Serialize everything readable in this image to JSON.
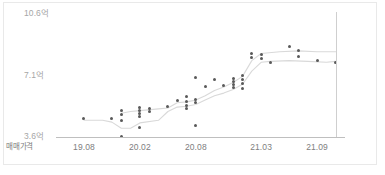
{
  "chart_data": {
    "type": "scatter",
    "title": "",
    "xlabel": "매매가격",
    "ylabel": "",
    "unit": "억",
    "grid": false,
    "legend": false,
    "y_ticks": [
      {
        "label": "3.6억",
        "value": 3.6
      },
      {
        "label": "7.1억",
        "value": 7.1
      },
      {
        "label": "10.6억",
        "value": 10.6
      }
    ],
    "ylim": [
      3.6,
      10.6
    ],
    "x_ticks": [
      {
        "label": "19.08",
        "value": 2019.08
      },
      {
        "label": "20.02",
        "value": 2020.02
      },
      {
        "label": "20.08",
        "value": 2020.08
      },
      {
        "label": "21.03",
        "value": 2021.03
      },
      {
        "label": "21.09",
        "value": 2021.09
      }
    ],
    "xlim": [
      2019.05,
      2022.0
    ],
    "annotations": [
      {
        "type": "vertical-line",
        "label": "",
        "x": 2021.11
      }
    ],
    "series": [
      {
        "name": "거래",
        "type": "scatter",
        "color": "#595959",
        "points": [
          {
            "x": 2019.08,
            "y": 4.65
          },
          {
            "x": 2019.11,
            "y": 4.65
          },
          {
            "x": 2019.12,
            "y": 5.1
          },
          {
            "x": 2019.12,
            "y": 4.9
          },
          {
            "x": 2019.12,
            "y": 4.55
          },
          {
            "x": 2019.12,
            "y": 3.62
          },
          {
            "x": 2020.02,
            "y": 5.3
          },
          {
            "x": 2020.02,
            "y": 5.1
          },
          {
            "x": 2020.02,
            "y": 4.95
          },
          {
            "x": 2020.02,
            "y": 4.75
          },
          {
            "x": 2020.02,
            "y": 4.15
          },
          {
            "x": 2020.03,
            "y": 5.2
          },
          {
            "x": 2020.03,
            "y": 5.05
          },
          {
            "x": 2020.05,
            "y": 5.35
          },
          {
            "x": 2020.06,
            "y": 5.7
          },
          {
            "x": 2020.07,
            "y": 5.9
          },
          {
            "x": 2020.07,
            "y": 5.6
          },
          {
            "x": 2020.07,
            "y": 5.4
          },
          {
            "x": 2020.07,
            "y": 5.25
          },
          {
            "x": 2020.08,
            "y": 7.0
          },
          {
            "x": 2020.08,
            "y": 5.75
          },
          {
            "x": 2020.08,
            "y": 5.55
          },
          {
            "x": 2020.08,
            "y": 4.25
          },
          {
            "x": 2020.09,
            "y": 6.45
          },
          {
            "x": 2020.1,
            "y": 6.9
          },
          {
            "x": 2020.11,
            "y": 6.55
          },
          {
            "x": 2020.12,
            "y": 6.95
          },
          {
            "x": 2020.12,
            "y": 6.75
          },
          {
            "x": 2020.12,
            "y": 6.6
          },
          {
            "x": 2020.12,
            "y": 6.4
          },
          {
            "x": 2021.01,
            "y": 7.1
          },
          {
            "x": 2021.01,
            "y": 6.9
          },
          {
            "x": 2021.01,
            "y": 6.65
          },
          {
            "x": 2021.01,
            "y": 6.35
          },
          {
            "x": 2021.02,
            "y": 8.35
          },
          {
            "x": 2021.02,
            "y": 8.15
          },
          {
            "x": 2021.03,
            "y": 8.3
          },
          {
            "x": 2021.03,
            "y": 8.05
          },
          {
            "x": 2021.04,
            "y": 7.85
          },
          {
            "x": 2021.06,
            "y": 8.75
          },
          {
            "x": 2021.07,
            "y": 8.5
          },
          {
            "x": 2021.07,
            "y": 8.2
          },
          {
            "x": 2021.09,
            "y": 7.95
          },
          {
            "x": 2021.11,
            "y": 7.85
          }
        ]
      },
      {
        "name": "추세선",
        "type": "line",
        "color": "#d9d9d9",
        "points": [
          {
            "x": 2019.08,
            "y": 4.55
          },
          {
            "x": 2019.1,
            "y": 4.55
          },
          {
            "x": 2019.11,
            "y": 4.45
          },
          {
            "x": 2019.12,
            "y": 4.1
          },
          {
            "x": 2020.01,
            "y": 4.1
          },
          {
            "x": 2020.02,
            "y": 4.4
          },
          {
            "x": 2020.04,
            "y": 4.55
          },
          {
            "x": 2020.05,
            "y": 5.05
          },
          {
            "x": 2020.06,
            "y": 5.3
          },
          {
            "x": 2020.07,
            "y": 5.35
          },
          {
            "x": 2020.08,
            "y": 5.45
          },
          {
            "x": 2020.09,
            "y": 5.7
          },
          {
            "x": 2020.1,
            "y": 5.95
          },
          {
            "x": 2020.11,
            "y": 6.1
          },
          {
            "x": 2020.12,
            "y": 6.3
          },
          {
            "x": 2021.01,
            "y": 6.6
          },
          {
            "x": 2021.02,
            "y": 7.35
          },
          {
            "x": 2021.03,
            "y": 7.85
          },
          {
            "x": 2021.04,
            "y": 7.9
          },
          {
            "x": 2021.06,
            "y": 7.95
          },
          {
            "x": 2021.08,
            "y": 7.9
          },
          {
            "x": 2021.1,
            "y": 7.85
          },
          {
            "x": 2021.11,
            "y": 7.9
          }
        ]
      },
      {
        "name": "추세선 상단",
        "type": "line",
        "color": "#d9d9d9",
        "points": [
          {
            "x": 2019.12,
            "y": 4.95
          },
          {
            "x": 2020.01,
            "y": 5.05
          },
          {
            "x": 2020.02,
            "y": 5.1
          },
          {
            "x": 2020.04,
            "y": 5.2
          },
          {
            "x": 2020.05,
            "y": 5.25
          },
          {
            "x": 2020.06,
            "y": 5.55
          },
          {
            "x": 2020.07,
            "y": 5.6
          },
          {
            "x": 2020.08,
            "y": 5.7
          },
          {
            "x": 2020.09,
            "y": 5.95
          },
          {
            "x": 2020.1,
            "y": 6.25
          },
          {
            "x": 2020.11,
            "y": 6.45
          },
          {
            "x": 2020.12,
            "y": 6.7
          },
          {
            "x": 2021.01,
            "y": 7.05
          },
          {
            "x": 2021.02,
            "y": 7.95
          },
          {
            "x": 2021.03,
            "y": 8.35
          },
          {
            "x": 2021.05,
            "y": 8.45
          },
          {
            "x": 2021.07,
            "y": 8.5
          },
          {
            "x": 2021.09,
            "y": 8.45
          },
          {
            "x": 2021.11,
            "y": 8.45
          }
        ]
      }
    ]
  }
}
